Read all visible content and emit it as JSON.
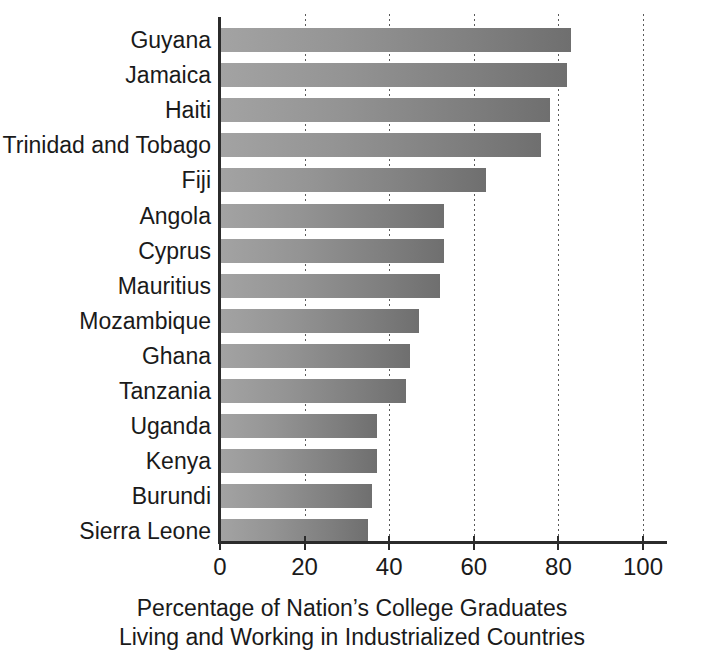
{
  "chart_data": {
    "type": "bar",
    "orientation": "horizontal",
    "title": "",
    "subtitle": "",
    "xlabel": "Percentage of Nation's College Graduates Living and Working in Industrialized Countries",
    "ylabel": "",
    "xlim": [
      0,
      100
    ],
    "xticks": [
      0,
      20,
      40,
      60,
      80,
      100
    ],
    "xtick_labels": [
      "0",
      "20",
      "40",
      "60",
      "80",
      "100"
    ],
    "grid": "vertical-dotted",
    "legend": "none",
    "bar_color_left": "#a3a3a3",
    "bar_color_right": "#6f6f6f",
    "categories": [
      "Guyana",
      "Jamaica",
      "Haiti",
      "Trinidad and Tobago",
      "Fiji",
      "Angola",
      "Cyprus",
      "Mauritius",
      "Mozambique",
      "Ghana",
      "Tanzania",
      "Uganda",
      "Kenya",
      "Burundi",
      "Sierra Leone"
    ],
    "values": [
      83,
      82,
      78,
      76,
      63,
      53,
      53,
      52,
      47,
      45,
      44,
      37,
      37,
      36,
      35
    ]
  },
  "caption": {
    "line1": "Percentage of Nation’s College Graduates",
    "line2": "Living and Working in Industrialized Countries"
  }
}
